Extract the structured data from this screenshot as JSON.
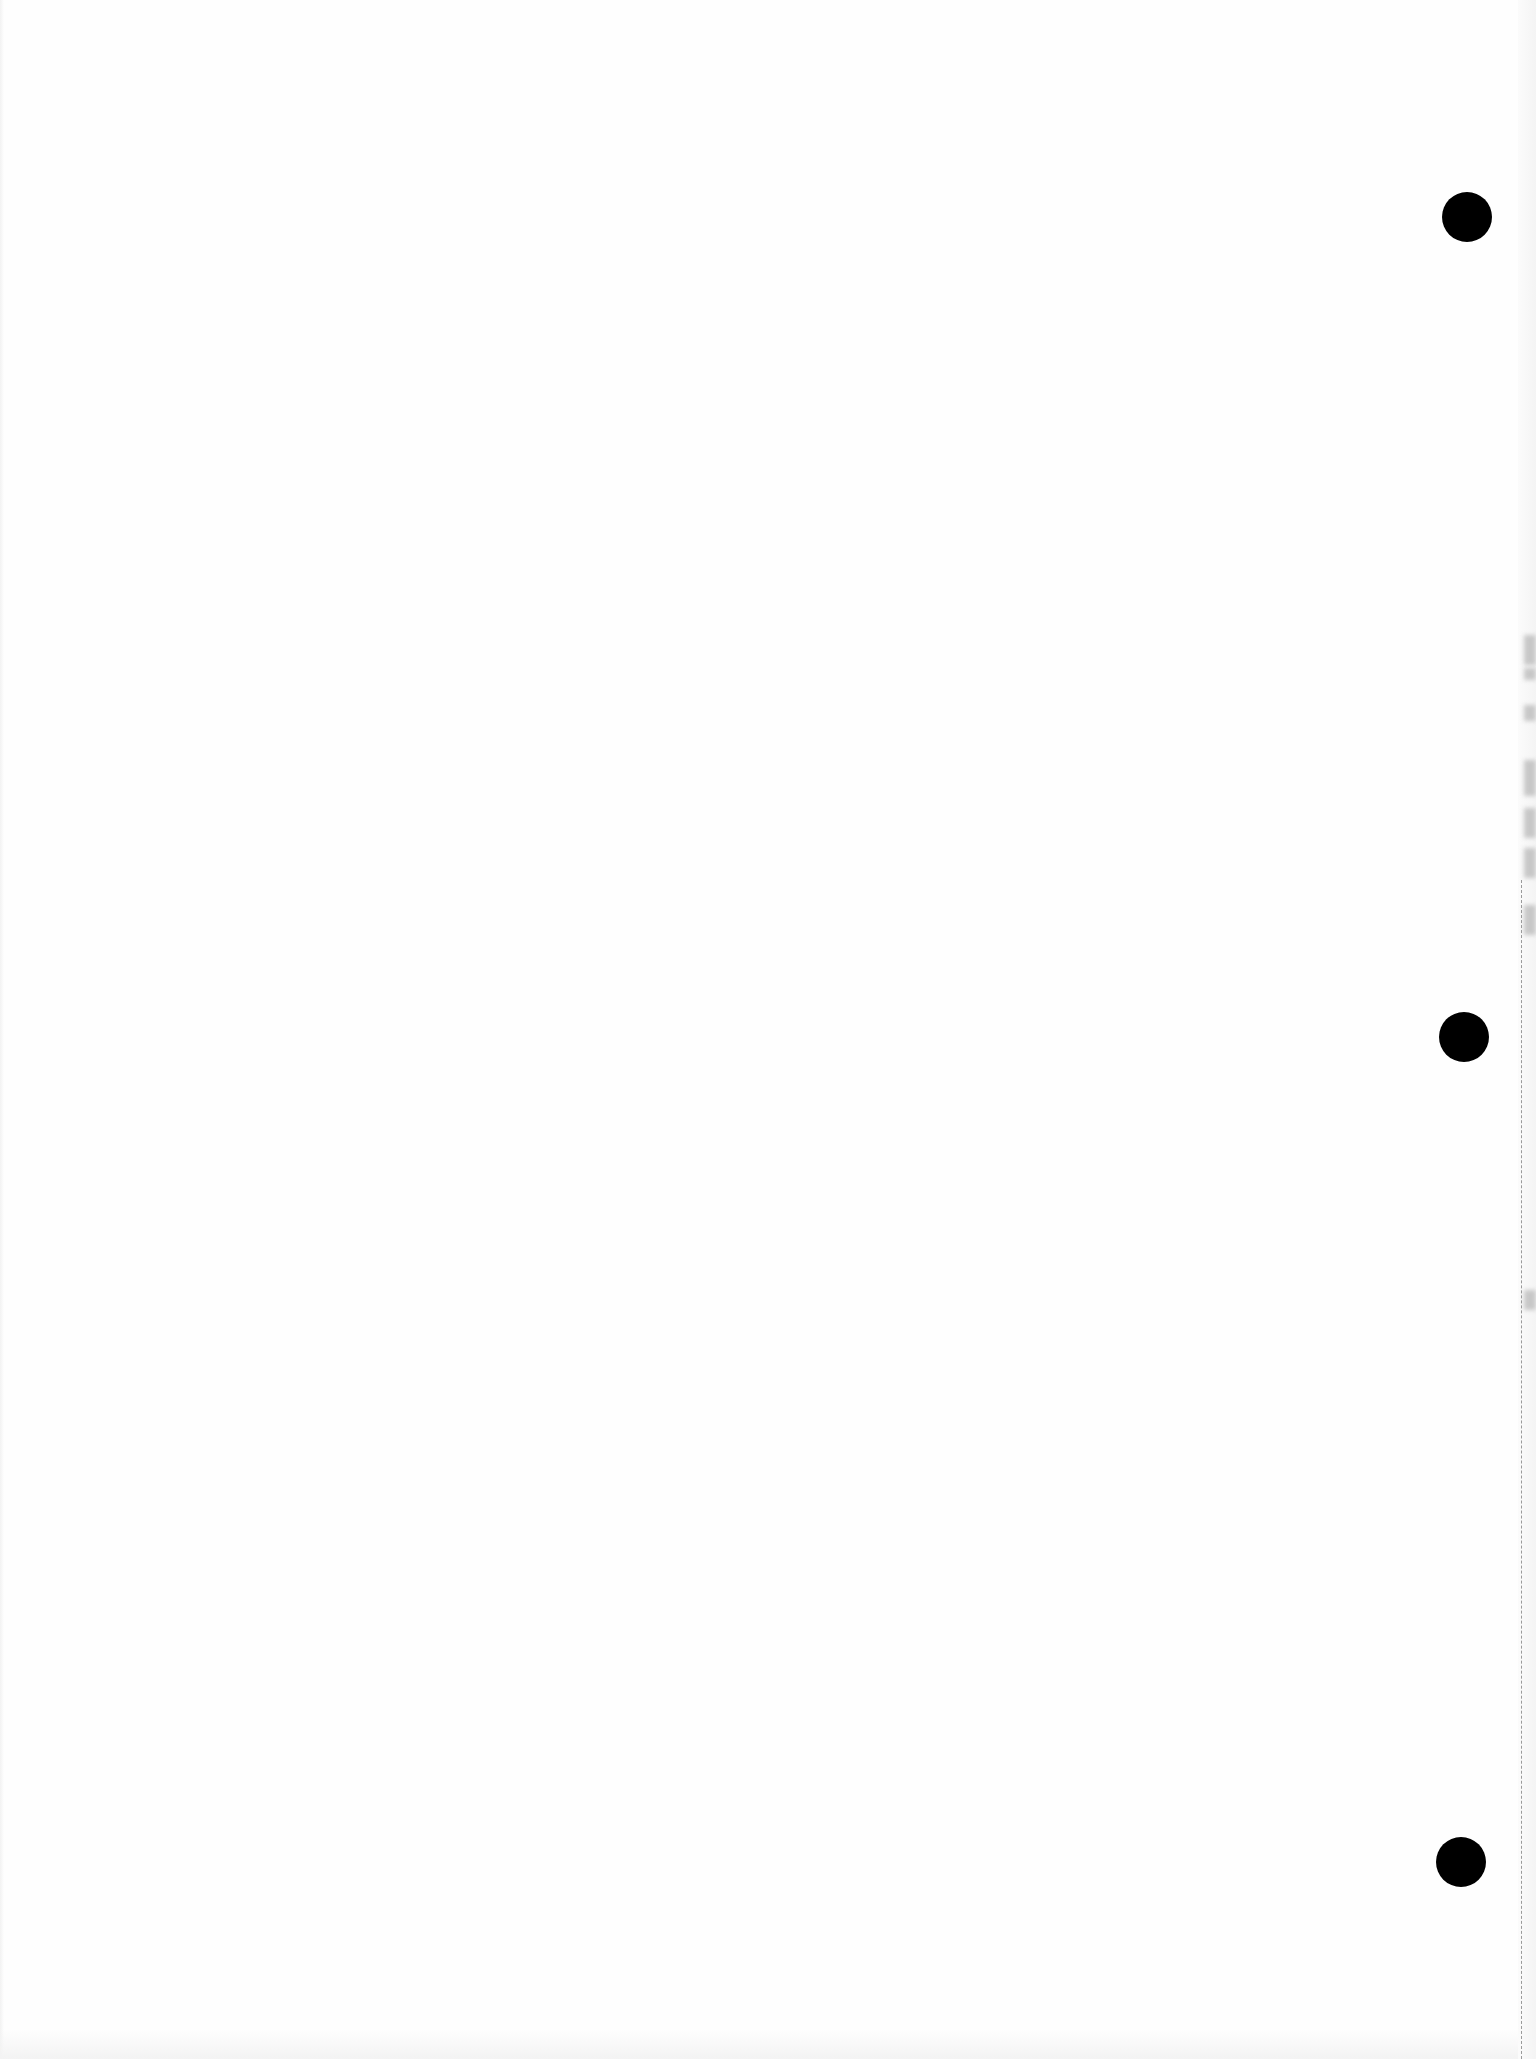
{
  "page": {
    "type": "blank scanned page",
    "background_color": "#fefefe",
    "text_content": ""
  },
  "punch_holes": [
    {
      "cx": 1467,
      "cy": 217,
      "diameter": 50,
      "color": "#000000"
    },
    {
      "cx": 1464,
      "cy": 1037,
      "diameter": 50,
      "color": "#000000"
    },
    {
      "cx": 1461,
      "cy": 1862,
      "diameter": 50,
      "color": "#000000"
    }
  ],
  "edge_artifacts": {
    "scan_shadow_segments": [
      {
        "top": 635,
        "height": 30
      },
      {
        "top": 668,
        "height": 12
      },
      {
        "top": 705,
        "height": 16
      },
      {
        "top": 760,
        "height": 36
      },
      {
        "top": 808,
        "height": 30
      },
      {
        "top": 848,
        "height": 30
      },
      {
        "top": 905,
        "height": 30
      },
      {
        "top": 1290,
        "height": 20
      }
    ],
    "dashed_line": {
      "x": 1521,
      "top": 880,
      "color": "#9a9a9a"
    }
  }
}
